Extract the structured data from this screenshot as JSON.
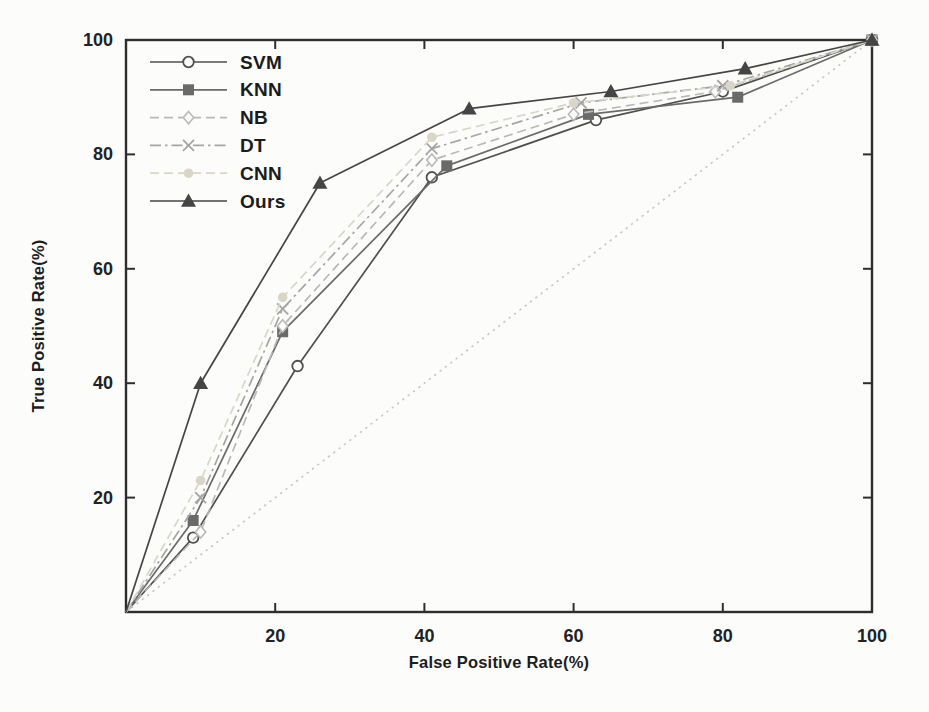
{
  "figure": {
    "background": "#fcfcfb",
    "frame_color": "#2e2e2e",
    "text_color": "#1d1d1d"
  },
  "chart_data": {
    "type": "line",
    "title": "",
    "xlabel": "False Positive Rate(%)",
    "ylabel": "True Positive Rate(%)",
    "xlim": [
      0,
      100
    ],
    "ylim": [
      0,
      100
    ],
    "xticks": [
      20,
      40,
      60,
      80,
      100
    ],
    "yticks": [
      20,
      40,
      60,
      80,
      100
    ],
    "grid": false,
    "legend_position": "top-left-inside",
    "series": [
      {
        "name": "SVM",
        "marker": "circle-open",
        "dash": "solid",
        "color": "#4f4f4f",
        "points": [
          [
            0,
            0
          ],
          [
            9,
            13
          ],
          [
            23,
            43
          ],
          [
            41,
            76
          ],
          [
            63,
            86
          ],
          [
            80,
            91
          ],
          [
            100,
            100
          ]
        ]
      },
      {
        "name": "KNN",
        "marker": "square-filled",
        "dash": "solid",
        "color": "#6a6a6a",
        "points": [
          [
            0,
            0
          ],
          [
            9,
            16
          ],
          [
            21,
            49
          ],
          [
            43,
            78
          ],
          [
            62,
            87
          ],
          [
            82,
            90
          ],
          [
            100,
            100
          ]
        ]
      },
      {
        "name": "NB",
        "marker": "diamond-open",
        "dash": "dashed",
        "color": "#b9b9b9",
        "points": [
          [
            0,
            0
          ],
          [
            10,
            14
          ],
          [
            21,
            50
          ],
          [
            41,
            79
          ],
          [
            60,
            87
          ],
          [
            79,
            91
          ],
          [
            100,
            100
          ]
        ]
      },
      {
        "name": "DT",
        "marker": "x-cross",
        "dash": "dashdot",
        "color": "#a5a5a5",
        "points": [
          [
            0,
            0
          ],
          [
            10,
            20
          ],
          [
            21,
            53
          ],
          [
            41,
            81
          ],
          [
            61,
            89
          ],
          [
            80,
            92
          ],
          [
            100,
            100
          ]
        ]
      },
      {
        "name": "CNN",
        "marker": "circle-filled",
        "dash": "dashed",
        "color": "#d9d6c8",
        "points": [
          [
            0,
            0
          ],
          [
            10,
            23
          ],
          [
            21,
            55
          ],
          [
            41,
            83
          ],
          [
            60,
            89
          ],
          [
            81,
            92
          ],
          [
            100,
            100
          ]
        ]
      },
      {
        "name": "Ours",
        "marker": "triangle-filled",
        "dash": "solid",
        "color": "#454545",
        "points": [
          [
            0,
            0
          ],
          [
            10,
            40
          ],
          [
            26,
            75
          ],
          [
            46,
            88
          ],
          [
            65,
            91
          ],
          [
            83,
            95
          ],
          [
            100,
            100
          ]
        ]
      }
    ],
    "reference_line": {
      "name": "chance-diagonal",
      "style": "dotted",
      "color": "#c6c6c6",
      "points": [
        [
          0,
          0
        ],
        [
          100,
          100
        ]
      ]
    }
  }
}
